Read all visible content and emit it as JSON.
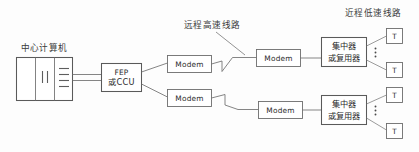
{
  "diagram": {
    "title_alt": "中心计算机远程终端网络拓扑图",
    "labels": {
      "central_computer": "中心计算机",
      "remote_highspeed_line": "远程高速线路",
      "local_lowspeed_line": "近程低速线路"
    },
    "nodes": {
      "fep": {
        "line1": "FEP",
        "line2": "或CCU"
      },
      "modem": {
        "label": "Modem"
      },
      "concentrator": {
        "line1": "集中器",
        "line2": "或复用器"
      },
      "terminal": {
        "label": "T"
      }
    },
    "branches": [
      {
        "id": "upper",
        "near_modem": "Modem",
        "far_modem": "Modem",
        "concentrator_line1": "集中器",
        "concentrator_line2": "或复用器",
        "terminals": [
          "T",
          "T"
        ],
        "ellipsis": "⋮"
      },
      {
        "id": "lower",
        "near_modem": "Modem",
        "far_modem": "Modem",
        "concentrator_line1": "集中器",
        "concentrator_line2": "或复用器",
        "terminals": [
          "T",
          "T"
        ],
        "ellipsis": "⋮"
      }
    ],
    "colors": {
      "background": "#fdfdfd",
      "stroke": "#6d6d6d",
      "text": "#2b2b2b",
      "label_text": "#3a3a3a"
    }
  }
}
